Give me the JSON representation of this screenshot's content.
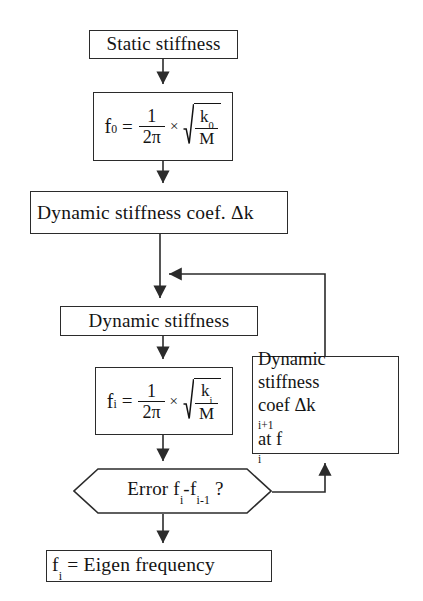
{
  "diagram": {
    "type": "flowchart",
    "background_color": "#ffffff",
    "line_color": "#2b2b2b",
    "text_color": "#141414"
  },
  "nodes": {
    "static_stiffness": {
      "label": "Static  stiffness",
      "shape": "rectangle"
    },
    "formula_f0": {
      "shape": "rectangle",
      "expression": "f_0 = 1/(2π) × √(k_0/M)",
      "lhs": "f",
      "lhs_sub": "0",
      "equals": "=",
      "fraction_numerator": "1",
      "fraction_denominator": "2π",
      "times": "×",
      "radicand_numerator": "k",
      "radicand_numerator_sub": "0",
      "radicand_denominator": "M"
    },
    "dynamic_stiffness_coef": {
      "label": "Dynamic stiffness coef. Δk",
      "shape": "rectangle"
    },
    "dynamic_stiffness": {
      "label": "Dynamic stiffness",
      "shape": "rectangle"
    },
    "formula_fi": {
      "shape": "rectangle",
      "expression": "f_i = 1/(2π) × √(k_i/M)",
      "lhs": "f",
      "lhs_sub": "i",
      "equals": "=",
      "fraction_numerator": "1",
      "fraction_denominator": "2π",
      "times": "×",
      "radicand_numerator": "k",
      "radicand_numerator_sub": "i",
      "radicand_denominator": "M"
    },
    "dynamic_stiffness_coef_next": {
      "shape": "rectangle",
      "lines": [
        "Dynamic",
        "stiffness",
        "coef Δk",
        "at f"
      ],
      "line1": "Dynamic",
      "line2": "stiffness",
      "line3_prefix": "coef Δk",
      "line3_sub": "i+1",
      "line3_mid": " at f",
      "line3_sub2": "i"
    },
    "error_check": {
      "shape": "hexagon",
      "label_prefix": "Error f",
      "label_sub1": "i",
      "label_mid": "-f",
      "label_sub2": "i-1",
      "label_suffix": " ?",
      "expression": "Error f_i - f_(i-1) ?"
    },
    "eigen_result": {
      "shape": "rectangle",
      "lhs": "f",
      "lhs_sub": "i",
      "rest": " = Eigen frequency",
      "expression": "f_i = Eigen frequency"
    }
  },
  "connectors": [
    {
      "name": "static-to-f0",
      "from": "static_stiffness",
      "to": "formula_f0",
      "style": "arrow-down"
    },
    {
      "name": "f0-to-dyncoef",
      "from": "formula_f0",
      "to": "dynamic_stiffness_coef",
      "style": "arrow-down"
    },
    {
      "name": "dyncoef-to-dynstiff",
      "from": "dynamic_stiffness_coef",
      "to": "dynamic_stiffness",
      "style": "arrow-down"
    },
    {
      "name": "dynstiff-to-fi",
      "from": "dynamic_stiffness",
      "to": "formula_fi",
      "style": "arrow-down"
    },
    {
      "name": "fi-to-errorcheck",
      "from": "formula_fi",
      "to": "error_check",
      "style": "arrow-down"
    },
    {
      "name": "errorcheck-to-eigen",
      "from": "error_check",
      "to": "eigen_result",
      "style": "arrow-down"
    },
    {
      "name": "errorcheck-to-coefnext",
      "from": "error_check",
      "to": "dynamic_stiffness_coef_next",
      "style": "elbow-arrow-up"
    },
    {
      "name": "coefnext-feedback-loop",
      "from": "dynamic_stiffness_coef_next",
      "to": "dyncoef-to-dynstiff-junction",
      "style": "elbow-arrow-left"
    }
  ]
}
